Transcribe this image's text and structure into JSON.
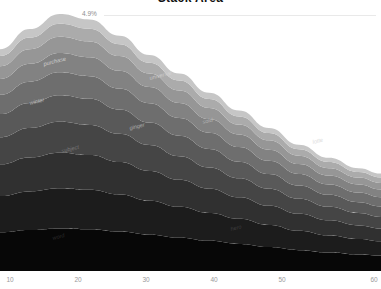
{
  "chart": {
    "title": "Stack Area",
    "annotation": "4.9%"
  },
  "chart_data": {
    "type": "area",
    "title": "Stack Area",
    "subtitle": "",
    "xlabel": "",
    "ylabel": "",
    "grid": false,
    "legend_position": "inline-labels",
    "annotations": [
      {
        "text": "4.9%",
        "x": 13,
        "y_frac": 0.95
      }
    ],
    "xlim": [
      9,
      60
    ],
    "xticks": [
      10,
      20,
      30,
      40,
      50,
      60
    ],
    "xtick_positions_px": [
      10,
      78,
      146,
      214,
      282,
      374
    ],
    "stacked": true,
    "normalized": false,
    "x": [
      9,
      13,
      17,
      21,
      25,
      29,
      33,
      37,
      41,
      45,
      49,
      53,
      57,
      60
    ],
    "series": [
      {
        "name": "word",
        "color": "#070707",
        "values": [
          10.0,
          10.6,
          11.0,
          10.8,
          10.2,
          9.4,
          8.6,
          7.8,
          7.0,
          6.2,
          5.4,
          4.8,
          4.3,
          4.0
        ]
      },
      {
        "name": "hero",
        "color": "#1c1c1c",
        "values": [
          9.4,
          10.0,
          10.4,
          10.2,
          9.6,
          8.8,
          8.0,
          7.2,
          6.5,
          5.7,
          5.0,
          4.4,
          4.0,
          3.7
        ]
      },
      {
        "name": "subject",
        "color": "#303030",
        "values": [
          8.2,
          8.8,
          9.2,
          9.0,
          8.4,
          7.7,
          7.0,
          6.3,
          5.6,
          5.0,
          4.4,
          3.9,
          3.5,
          3.3
        ]
      },
      {
        "name": "energy",
        "color": "#454545",
        "values": [
          7.0,
          7.6,
          8.0,
          7.8,
          7.3,
          6.7,
          6.1,
          5.5,
          4.9,
          4.4,
          3.9,
          3.5,
          3.2,
          3.0
        ]
      },
      {
        "name": "ginger",
        "color": "#595959",
        "values": [
          6.0,
          6.5,
          6.9,
          6.8,
          6.3,
          5.8,
          5.3,
          4.8,
          4.3,
          3.8,
          3.4,
          3.1,
          2.8,
          2.7
        ]
      },
      {
        "name": "sold",
        "color": "#6e6e6e",
        "values": [
          5.0,
          5.5,
          5.9,
          5.8,
          5.4,
          5.0,
          4.6,
          4.2,
          3.8,
          3.4,
          3.0,
          2.7,
          2.5,
          2.4
        ]
      },
      {
        "name": "winter",
        "color": "#828282",
        "values": [
          4.1,
          4.6,
          5.0,
          4.9,
          4.6,
          4.2,
          3.9,
          3.5,
          3.2,
          2.9,
          2.6,
          2.3,
          2.1,
          2.0
        ]
      },
      {
        "name": "universal",
        "color": "#969696",
        "values": [
          3.3,
          3.8,
          4.2,
          4.1,
          3.8,
          3.5,
          3.2,
          2.9,
          2.6,
          2.4,
          2.1,
          1.9,
          1.8,
          1.7
        ]
      },
      {
        "name": "lotte",
        "color": "#ababab",
        "values": [
          2.6,
          3.0,
          3.4,
          3.3,
          3.1,
          2.8,
          2.6,
          2.3,
          2.1,
          1.9,
          1.7,
          1.6,
          1.4,
          1.4
        ]
      },
      {
        "name": "purchase",
        "color": "#c6c6c6",
        "values": [
          1.8,
          2.2,
          2.5,
          2.4,
          2.2,
          2.0,
          1.8,
          1.6,
          1.5,
          1.3,
          1.2,
          1.1,
          1.0,
          1.0
        ]
      }
    ],
    "inline_labels": [
      {
        "text": "purchase",
        "x_px": 44,
        "y_px": 66,
        "color": "#e6e6e6"
      },
      {
        "text": "universal",
        "x_px": 150,
        "y_px": 80,
        "color": "#dcdcdc"
      },
      {
        "text": "winter",
        "x_px": 30,
        "y_px": 105,
        "color": "#d2d2d2"
      },
      {
        "text": "ginger",
        "x_px": 130,
        "y_px": 130,
        "color": "#c8c8c8"
      },
      {
        "text": "sold",
        "x_px": 203,
        "y_px": 124,
        "color": "#c8c8c8"
      },
      {
        "text": "lotte",
        "x_px": 313,
        "y_px": 144,
        "color": "#cfcfcf"
      },
      {
        "text": "subject",
        "x_px": 62,
        "y_px": 153,
        "color": "#8e8e8e"
      },
      {
        "text": "hero",
        "x_px": 231,
        "y_px": 231,
        "color": "#4a4a4a"
      },
      {
        "text": "word",
        "x_px": 53,
        "y_px": 240,
        "color": "#3c3c3c"
      }
    ]
  }
}
